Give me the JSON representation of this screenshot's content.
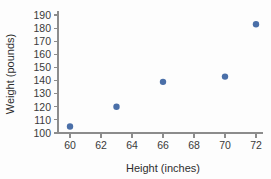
{
  "chart_data": {
    "type": "scatter",
    "title": "",
    "xlabel": "Height (inches)",
    "ylabel": "Weight (pounds)",
    "xlim": [
      59,
      73
    ],
    "ylim": [
      98,
      192
    ],
    "grid": false,
    "legend": "none",
    "marker_color": "#4a6fa8",
    "axis_color": "#8c8c8c",
    "x_ticks": [
      60,
      62,
      64,
      66,
      68,
      70,
      72
    ],
    "y_ticks": [
      100,
      110,
      120,
      130,
      140,
      150,
      160,
      170,
      180,
      190
    ],
    "x_tick_labels": [
      "60",
      "62",
      "64",
      "66",
      "68",
      "70",
      "72"
    ],
    "y_tick_labels": [
      "100",
      "110",
      "120",
      "130",
      "140",
      "150",
      "160",
      "170",
      "180",
      "190"
    ],
    "x": [
      60,
      63,
      66,
      70,
      72
    ],
    "y": [
      105,
      120,
      139,
      143,
      183
    ],
    "points": [
      {
        "x": 60,
        "y": 105
      },
      {
        "x": 63,
        "y": 120
      },
      {
        "x": 66,
        "y": 139
      },
      {
        "x": 70,
        "y": 143
      },
      {
        "x": 72,
        "y": 183
      }
    ]
  }
}
